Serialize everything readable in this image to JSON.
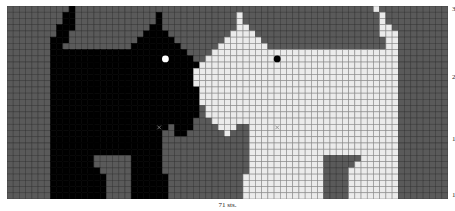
{
  "chart": {
    "columns": 71,
    "rows": 31,
    "colors": {
      "background": "#5a5a5a",
      "black_dog": "#000000",
      "white_dog": "#ebebeb",
      "grid_on_dark": "#3a3a3a",
      "grid_on_light": "#8a8a8a",
      "eye_on_black": "#ffffff",
      "eye_on_white": "#000000"
    },
    "row_labels": [
      {
        "row": 31,
        "text": "31"
      },
      {
        "row": 20,
        "text": "20"
      },
      {
        "row": 10,
        "text": "10"
      },
      {
        "row": 1,
        "text": "1"
      }
    ],
    "bottom_label": "71 sts.",
    "black_dog_spans": [
      [
        [
          10,
          10
        ]
      ],
      [
        [
          9,
          10
        ],
        [
          24,
          24
        ]
      ],
      [
        [
          9,
          10
        ],
        [
          24,
          24
        ]
      ],
      [
        [
          8,
          10
        ],
        [
          23,
          24
        ]
      ],
      [
        [
          8,
          9
        ],
        [
          22,
          25
        ]
      ],
      [
        [
          7,
          9
        ],
        [
          21,
          26
        ]
      ],
      [
        [
          7,
          8
        ],
        [
          20,
          27
        ]
      ],
      [
        [
          7,
          28
        ]
      ],
      [
        [
          7,
          29
        ]
      ],
      [
        [
          7,
          30
        ]
      ],
      [
        [
          7,
          31
        ]
      ],
      [
        [
          7,
          32
        ]
      ],
      [
        [
          7,
          32
        ]
      ],
      [
        [
          7,
          32
        ]
      ],
      [
        [
          7,
          31
        ]
      ],
      [
        [
          7,
          31
        ]
      ],
      [
        [
          7,
          30
        ]
      ],
      [
        [
          7,
          30
        ]
      ],
      [
        [
          7,
          29
        ]
      ],
      [
        [
          7,
          25
        ],
        [
          27,
          29
        ]
      ],
      [
        [
          7,
          24
        ],
        [
          27,
          28
        ]
      ],
      [
        [
          7,
          24
        ]
      ],
      [
        [
          7,
          24
        ]
      ],
      [
        [
          7,
          24
        ]
      ],
      [
        [
          7,
          13
        ],
        [
          20,
          24
        ]
      ],
      [
        [
          7,
          13
        ],
        [
          20,
          24
        ]
      ],
      [
        [
          7,
          14
        ],
        [
          20,
          24
        ]
      ],
      [
        [
          7,
          15
        ],
        [
          20,
          25
        ]
      ],
      [
        [
          7,
          15
        ],
        [
          20,
          25
        ]
      ],
      [
        [
          7,
          15
        ],
        [
          20,
          25
        ]
      ],
      [
        [
          7,
          15
        ],
        [
          20,
          25
        ]
      ]
    ],
    "white_dog_spans": [
      [
        [
          59,
          59
        ]
      ],
      [
        [
          37,
          37
        ],
        [
          60,
          60
        ]
      ],
      [
        [
          37,
          37
        ],
        [
          60,
          60
        ]
      ],
      [
        [
          37,
          38
        ],
        [
          60,
          61
        ]
      ],
      [
        [
          36,
          39
        ],
        [
          60,
          62
        ]
      ],
      [
        [
          35,
          40
        ],
        [
          61,
          62
        ]
      ],
      [
        [
          34,
          41
        ],
        [
          61,
          62
        ]
      ],
      [
        [
          33,
          62
        ]
      ],
      [
        [
          32,
          62
        ]
      ],
      [
        [
          31,
          62
        ]
      ],
      [
        [
          30,
          62
        ]
      ],
      [
        [
          30,
          62
        ]
      ],
      [
        [
          30,
          62
        ]
      ],
      [
        [
          31,
          62
        ]
      ],
      [
        [
          31,
          62
        ]
      ],
      [
        [
          31,
          62
        ]
      ],
      [
        [
          32,
          62
        ]
      ],
      [
        [
          32,
          62
        ]
      ],
      [
        [
          33,
          62
        ]
      ],
      [
        [
          34,
          36
        ],
        [
          39,
          62
        ]
      ],
      [
        [
          35,
          35
        ],
        [
          39,
          62
        ]
      ],
      [
        [
          39,
          62
        ]
      ],
      [
        [
          39,
          62
        ]
      ],
      [
        [
          39,
          62
        ]
      ],
      [
        [
          39,
          50
        ],
        [
          57,
          62
        ]
      ],
      [
        [
          39,
          50
        ],
        [
          56,
          62
        ]
      ],
      [
        [
          39,
          50
        ],
        [
          55,
          62
        ]
      ],
      [
        [
          38,
          50
        ],
        [
          55,
          62
        ]
      ],
      [
        [
          38,
          50
        ],
        [
          55,
          62
        ]
      ],
      [
        [
          38,
          50
        ],
        [
          55,
          62
        ]
      ],
      [
        [
          38,
          50
        ],
        [
          55,
          62
        ]
      ]
    ],
    "eyes": [
      {
        "dog": "black",
        "col": 25,
        "row_from_top": 8
      },
      {
        "dog": "white",
        "col": 43,
        "row_from_top": 8
      }
    ],
    "x_marks": [
      {
        "col": 24,
        "row_from_top": 19
      },
      {
        "col": 43,
        "row_from_top": 19
      }
    ]
  }
}
